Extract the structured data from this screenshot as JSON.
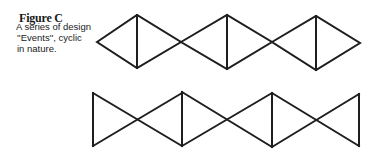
{
  "figure": {
    "title": "Figure C",
    "caption_lines": [
      "A series of design",
      "''Events'', cyclic",
      "in nature."
    ]
  },
  "patterns": {
    "top": {
      "description": "Chain of three diamonds, each bisected by a vertical line",
      "count": 3
    },
    "bottom": {
      "description": "Chain of bowtie shapes with vertical bars at ends and joins",
      "count": 3
    }
  },
  "colors": {
    "stroke": "#1e1e1e",
    "background": "#ffffff"
  }
}
